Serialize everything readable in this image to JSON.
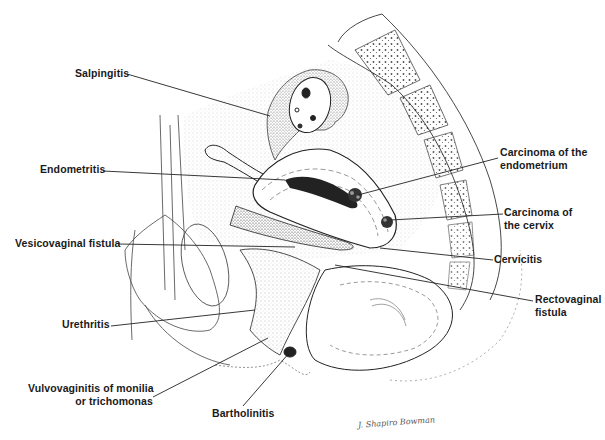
{
  "figure": {
    "signature": "J. Shapiro Bowman",
    "labels": {
      "salpingitis": "Salpingitis",
      "endometritis": "Endometritis",
      "vesicovaginal_fistula": "Vesicovaginal fistula",
      "urethritis": "Urethritis",
      "vulvovaginitis_line1": "Vulvovaginitis of monilia",
      "vulvovaginitis_line2": "or trichomonas",
      "bartholinitis": "Bartholinitis",
      "carcinoma_endometrium_line1": "Carcinoma of the",
      "carcinoma_endometrium_line2": "endometrium",
      "carcinoma_cervix_line1": "Carcinoma of",
      "carcinoma_cervix_line2": "the cervix",
      "cervicitis": "Cervicitis",
      "rectovaginal_line1": "Rectovaginal",
      "rectovaginal_line2": "fistula"
    }
  }
}
